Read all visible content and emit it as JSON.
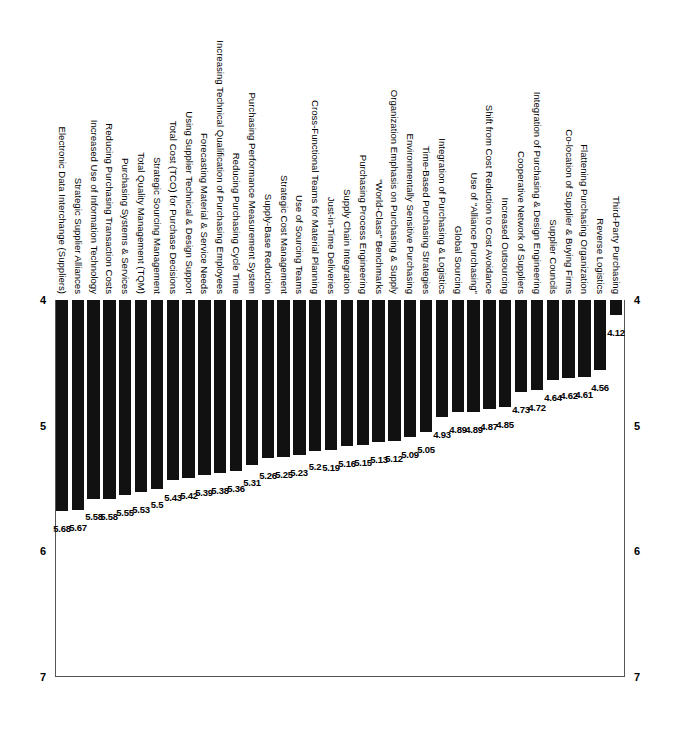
{
  "chart_data": {
    "type": "bar",
    "title": "",
    "subtitle": "",
    "xlabel": "",
    "ylabel": "",
    "orientation": "vertical-bars-rotated-90",
    "ylim": [
      4,
      7
    ],
    "yticks": [
      4,
      5,
      6,
      7
    ],
    "ytick_labels": [
      "4",
      "5",
      "6",
      "7"
    ],
    "ytick_labels_both_sides": true,
    "grid": false,
    "legend": null,
    "bar_color": "#111111",
    "axis_color": "#555555",
    "value_labels_shown": true,
    "categories": [
      "Third-Party Purchasing",
      "Reverse Logistics",
      "Flattening Purchasing Organization",
      "Co-location of Supplier & Buying Firms",
      "Supplier Councils",
      "Integration of Purchasing & Design Engineering",
      "Cooperative Network of Suppliers",
      "Increased Outsourcing",
      "Shift from Cost Reduction to Cost Avoidance",
      "Use of \"Alliance Purchasing\"",
      "Global Sourcing",
      "Integration of Purchasing & Logistics",
      "Time-Based Purchasing Strategies",
      "Environmentally Sensitive Purchasing",
      "Organization Emphasis on Purchasing & Supply",
      "\"World-Class\" Benchmarks",
      "Purchasing Process Engineering",
      "Supply Chain Integration",
      "Just-in-Time Deliveries",
      "Cross-Functional Teams for Material Planning",
      "Use of Sourcing Teams",
      "Strategic Cost Management",
      "Supply-Base Reduction",
      "Purchasing Performance Measurement System",
      "Reducing Purchasing Cycle Time",
      "Increasing Technical Qualification of Purchasing Employees",
      "Forecasting Material & Service Needs",
      "Using Supplier Technical & Design Support",
      "Total Cost (TCO) for Purchase Decisions",
      "Strategic Sourcing Management",
      "Total Quality Management (TQM)",
      "Purchasing Systems & Services",
      "Reducing Purchasing Transaction Costs",
      "Increased Use of Information Technology",
      "Strategic Supplier Alliances",
      "Electronic Data Interchange (Suppliers)"
    ],
    "values": [
      4.12,
      4.56,
      4.61,
      4.62,
      4.64,
      4.72,
      4.73,
      4.85,
      4.87,
      4.89,
      4.89,
      4.93,
      5.05,
      5.09,
      5.12,
      5.13,
      5.15,
      5.16,
      5.19,
      5.2,
      5.23,
      5.25,
      5.26,
      5.31,
      5.36,
      5.38,
      5.39,
      5.42,
      5.43,
      5.5,
      5.53,
      5.55,
      5.58,
      5.58,
      5.67,
      5.68
    ],
    "value_label_texts": [
      "4.12",
      "4.56",
      "4.61",
      "4.62",
      "4.64",
      "4.72",
      "4.73",
      "4.85",
      "4.87",
      "4.89",
      "4.89",
      "4.93",
      "5.05",
      "5.09",
      "5.12",
      "5.13",
      "5.15",
      "5.16",
      "5.19",
      "5.2",
      "5.23",
      "5.25",
      "5.26",
      "5.31",
      "5.36",
      "5.38",
      "5.39",
      "5.42",
      "5.43",
      "5.5",
      "5.53",
      "5.55",
      "5.58",
      "5.58",
      "5.67",
      "5.68"
    ]
  }
}
